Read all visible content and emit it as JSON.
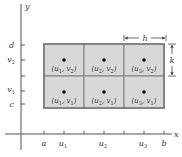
{
  "figure": {
    "colors": {
      "cell_fill": "#d8d8d8",
      "cell_border": "#8a8a8a",
      "axis": "#555555",
      "point": "#111111",
      "text": "#333333"
    },
    "axes": {
      "x_label": "x",
      "y_label": "y",
      "x_ticks": [
        {
          "label": "a",
          "sub": ""
        },
        {
          "label": "u",
          "sub": "1"
        },
        {
          "label": "",
          "sub": ""
        },
        {
          "label": "u",
          "sub": "2"
        },
        {
          "label": "",
          "sub": ""
        },
        {
          "label": "u",
          "sub": "3"
        },
        {
          "label": "b",
          "sub": ""
        }
      ],
      "y_ticks": [
        {
          "label": "d",
          "sub": ""
        },
        {
          "label": "v",
          "sub": "2"
        },
        {
          "label": "",
          "sub": ""
        },
        {
          "label": "v",
          "sub": "1"
        },
        {
          "label": "c",
          "sub": ""
        }
      ]
    },
    "grid": {
      "columns": 3,
      "rows": 2,
      "cells": [
        {
          "row": 0,
          "col": 0,
          "label": "(u1, v2)",
          "u": "1",
          "v": "2"
        },
        {
          "row": 0,
          "col": 1,
          "label": "(u2, v2)",
          "u": "2",
          "v": "2"
        },
        {
          "row": 0,
          "col": 2,
          "label": "(u3, v2)",
          "u": "3",
          "v": "2"
        },
        {
          "row": 1,
          "col": 0,
          "label": "(u1, v1)",
          "u": "1",
          "v": "1"
        },
        {
          "row": 1,
          "col": 1,
          "label": "(u2, v1)",
          "u": "2",
          "v": "1"
        },
        {
          "row": 1,
          "col": 2,
          "label": "(u3, v1)",
          "u": "3",
          "v": "1"
        }
      ]
    },
    "dimensions": {
      "width_label": "h",
      "height_label": "k"
    }
  }
}
